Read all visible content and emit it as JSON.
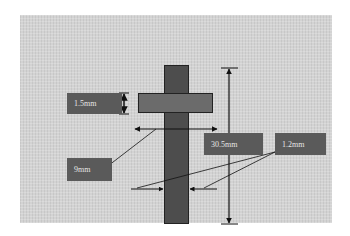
{
  "diagram": {
    "title": "",
    "labels": {
      "flange_thickness": "1.5mm",
      "flange_width": "9mm",
      "total_length": "30.5mm",
      "wall_thickness": "1.2mm"
    },
    "colors": {
      "background": "#d3d3d3",
      "vertical_bar": "#4d4d4d",
      "horizontal_bar": "#6b6b6b",
      "label_box": "#5a5a5a",
      "label_text": "#e6e6e6",
      "arrow": "#111111"
    }
  }
}
